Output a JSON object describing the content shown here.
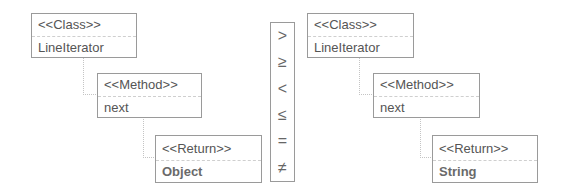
{
  "left_tree": {
    "class": {
      "stereotype": "<<Class>>",
      "name": "LineIterator"
    },
    "method": {
      "stereotype": "<<Method>>",
      "name": "next"
    },
    "return": {
      "stereotype": "<<Return>>",
      "type": "Object"
    }
  },
  "operators": [
    ">",
    "≥",
    "<",
    "≤",
    "=",
    "≠"
  ],
  "right_tree": {
    "class": {
      "stereotype": "<<Class>>",
      "name": "LineIterator"
    },
    "method": {
      "stereotype": "<<Method>>",
      "name": "next"
    },
    "return": {
      "stereotype": "<<Return>>",
      "type": "String"
    }
  }
}
